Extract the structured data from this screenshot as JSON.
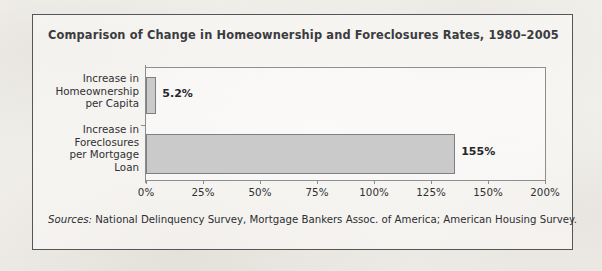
{
  "figure": {
    "title": "Comparison of Change in Homeownership and Foreclosures Rates, 1980–2005",
    "source_label": "Sources:",
    "source_text": " National Delinquency Survey, Mortgage Bankers Assoc. of  America; American Housing Survey.",
    "frame_color": "#55565a",
    "bar_fill_color": "#cacaca",
    "bar_border_color": "#7e7f83",
    "text_color": "#2f3034",
    "background_color": "#f4f2ee"
  },
  "chart_data": {
    "type": "bar",
    "orientation": "horizontal",
    "title": "Comparison of Change in Homeownership and Foreclosures Rates, 1980–2005",
    "categories": [
      "Increase in\nHomeownership\nper Capita",
      "Increase in\nForeclosures\nper Mortgage\nLoan"
    ],
    "values": [
      5.2,
      155
    ],
    "value_labels": [
      "5.2%",
      "155%"
    ],
    "xlabel": "",
    "ylabel": "",
    "xlim": [
      0,
      200
    ],
    "xticks": [
      0,
      25,
      50,
      75,
      100,
      125,
      150,
      200
    ],
    "xtick_labels": [
      "0%",
      "25%",
      "50%",
      "75%",
      "100%",
      "125%",
      "150%",
      "200%"
    ],
    "grid": false,
    "legend": false
  }
}
